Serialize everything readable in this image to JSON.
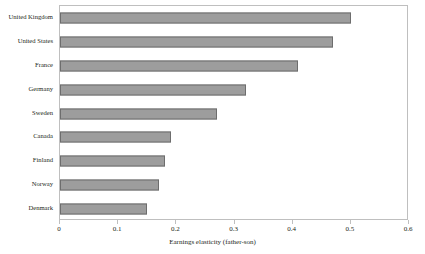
{
  "chart_data": {
    "type": "bar",
    "orientation": "horizontal",
    "title": "",
    "xlabel": "Earnings elasticity (father-son)",
    "ylabel": "",
    "categories": [
      "United Kingdom",
      "United States",
      "France",
      "Germany",
      "Sweden",
      "Canada",
      "Finland",
      "Norway",
      "Denmark"
    ],
    "values": [
      0.5,
      0.47,
      0.41,
      0.32,
      0.27,
      0.19,
      0.18,
      0.17,
      0.15
    ],
    "xlim": [
      0,
      0.6
    ],
    "xticks": [
      0,
      0.1,
      0.2,
      0.3,
      0.4,
      0.5,
      0.6
    ],
    "xtick_labels": [
      "0",
      "0.1",
      "0.2",
      "0.3",
      "0.4",
      "0.5",
      "0.6"
    ],
    "grid": false,
    "legend": null,
    "bar_fill_color": "#9d9d9d",
    "bar_border_color": "#6d6d6d",
    "frame_color": "#bfbfbf",
    "background_color": "#ffffff"
  }
}
